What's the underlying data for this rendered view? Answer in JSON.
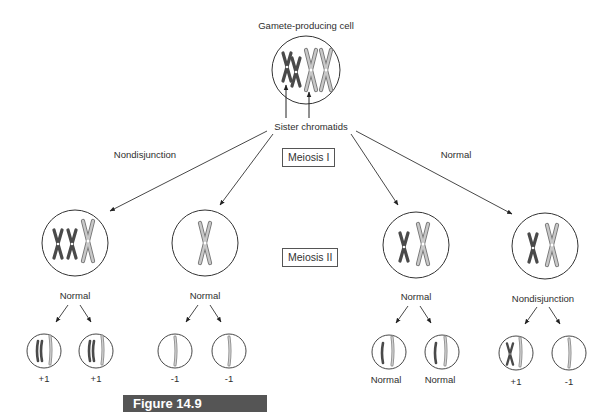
{
  "diagram": {
    "top_cell_label": "Gamete-producing cell",
    "sister_chromatids_label": "Sister chromatids",
    "meiosis1_label": "Meiosis I",
    "meiosis2_label": "Meiosis II",
    "left_branch_label": "Nondisjunction",
    "right_branch_label": "Normal",
    "meiosis2_cells": [
      {
        "label": "Normal",
        "outcome": "nondisjunction-in-meiosis-I (3 chromosomes)"
      },
      {
        "label": "Normal",
        "outcome": "nondisjunction-in-meiosis-I (1 chromosome)"
      },
      {
        "label": "Normal",
        "outcome": "normal (2 chromosomes)"
      },
      {
        "label": "Nondisjunction",
        "outcome": "normal (2 chromosomes)"
      }
    ],
    "gametes": [
      {
        "label": "+1"
      },
      {
        "label": "+1"
      },
      {
        "label": "-1"
      },
      {
        "label": "-1"
      },
      {
        "label": "Normal"
      },
      {
        "label": "Normal"
      },
      {
        "label": "+1"
      },
      {
        "label": "-1"
      }
    ],
    "figure_label": "Figure 14.9",
    "colors": {
      "dark_chromosome": "#555555",
      "light_chromosome": "#b8b8b8",
      "line": "#333333",
      "figure_bar": "#555555"
    }
  }
}
